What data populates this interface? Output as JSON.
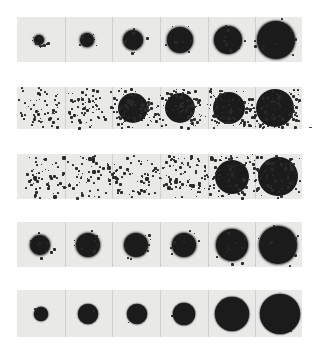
{
  "figure": {
    "background": "#ffffff",
    "strip_color": "#e9e9e7",
    "dot_color": "#1b1b1b",
    "strips": [
      {
        "id": 1,
        "x": 17,
        "y": 17,
        "w": 285,
        "h": 45,
        "style": "ragged",
        "spots": [
          {
            "cx": 39,
            "r": 5
          },
          {
            "cx": 87,
            "r": 7
          },
          {
            "cx": 133,
            "r": 10
          },
          {
            "cx": 180,
            "r": 13
          },
          {
            "cx": 228,
            "r": 14
          },
          {
            "cx": 276,
            "r": 19
          }
        ]
      },
      {
        "id": 2,
        "x": 17,
        "y": 87,
        "w": 285,
        "h": 42,
        "style": "scattered",
        "spots": [
          {
            "cx": 40,
            "r": 12,
            "density": 0.35
          },
          {
            "cx": 86,
            "r": 12,
            "density": 0.45
          },
          {
            "cx": 133,
            "r": 15,
            "density": 0.85
          },
          {
            "cx": 180,
            "r": 15,
            "density": 0.95
          },
          {
            "cx": 229,
            "r": 16,
            "density": 1
          },
          {
            "cx": 275,
            "r": 19,
            "density": 1
          }
        ]
      },
      {
        "id": 3,
        "x": 17,
        "y": 154,
        "w": 285,
        "h": 45,
        "style": "diffuse",
        "spots": [
          {
            "cx": 40,
            "r": 15,
            "density": 0.35
          },
          {
            "cx": 86,
            "r": 16,
            "density": 0.4
          },
          {
            "cx": 135,
            "r": 16,
            "density": 0.55
          },
          {
            "cx": 182,
            "r": 16,
            "density": 0.75
          },
          {
            "cx": 232,
            "r": 20,
            "density": 0.85
          },
          {
            "cx": 278,
            "r": 23,
            "density": 0.95
          }
        ]
      },
      {
        "id": 4,
        "x": 17,
        "y": 222,
        "w": 285,
        "h": 45,
        "style": "ragged",
        "spots": [
          {
            "cx": 40,
            "r": 10
          },
          {
            "cx": 88,
            "r": 12
          },
          {
            "cx": 136,
            "r": 12
          },
          {
            "cx": 184,
            "r": 12
          },
          {
            "cx": 232,
            "r": 16
          },
          {
            "cx": 278,
            "r": 19
          }
        ]
      },
      {
        "id": 5,
        "x": 17,
        "y": 290,
        "w": 285,
        "h": 47,
        "style": "solid",
        "spots": [
          {
            "cx": 41,
            "r": 7
          },
          {
            "cx": 88,
            "r": 10
          },
          {
            "cx": 137,
            "r": 10
          },
          {
            "cx": 184,
            "r": 11
          },
          {
            "cx": 232,
            "r": 17
          },
          {
            "cx": 280,
            "r": 20
          }
        ]
      }
    ],
    "panel_dividers_x": [
      65,
      112,
      160,
      208,
      255
    ]
  }
}
